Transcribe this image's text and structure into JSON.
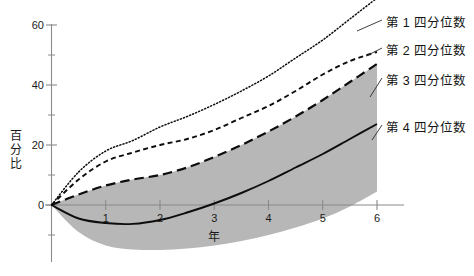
{
  "chart_data": {
    "type": "line",
    "title": "",
    "xlabel": "年",
    "ylabel": "百分比",
    "xlim": [
      0,
      6
    ],
    "ylim": [
      -20,
      72
    ],
    "grid": false,
    "legend_position": "right",
    "x_ticks": [
      "1",
      "2",
      "3",
      "4",
      "5",
      "6"
    ],
    "x_tick_values": [
      1,
      2,
      3,
      4,
      5,
      6
    ],
    "y_ticks": [
      "0",
      "20",
      "40",
      "60"
    ],
    "y_tick_values": [
      0,
      20,
      40,
      60
    ],
    "y_minor_tick_values": [
      -10,
      10,
      30,
      50,
      70
    ],
    "x": [
      0,
      0.5,
      1,
      1.5,
      2,
      2.5,
      3,
      3.5,
      4,
      4.5,
      5,
      5.5,
      6
    ],
    "series": [
      {
        "name": "第 1 四分位数",
        "style": "dotted",
        "values": [
          0,
          11,
          18,
          21.5,
          26,
          29.5,
          33.5,
          38,
          43,
          49,
          55,
          62,
          69
        ]
      },
      {
        "name": "第 2 四分位数",
        "style": "short-dashed",
        "values": [
          0,
          8.5,
          14.5,
          17.5,
          20,
          22,
          25,
          29,
          33,
          38,
          43.5,
          48,
          51
        ]
      },
      {
        "name": "第 3 四分位数",
        "style": "long-dashed",
        "values": [
          0,
          3.5,
          6.5,
          8.5,
          10,
          12.5,
          16,
          20,
          24.5,
          29.5,
          35,
          41,
          47
        ]
      },
      {
        "name": "第 4 四分位数",
        "style": "solid",
        "values": [
          0,
          -4.5,
          -6,
          -6.3,
          -5,
          -2.5,
          0.5,
          4,
          8,
          12.5,
          17,
          22,
          27
        ]
      }
    ],
    "band": {
      "name": "range-band",
      "color": "#b7b7b7",
      "upper": [
        0,
        3.5,
        6.5,
        8.5,
        10,
        12.5,
        16,
        20,
        24.5,
        29.5,
        35,
        41,
        47
      ],
      "lower": [
        0,
        -9,
        -13.5,
        -14.8,
        -15,
        -14.5,
        -13.5,
        -12,
        -10,
        -7.5,
        -4.5,
        -0.5,
        4.5
      ]
    },
    "legend": [
      {
        "label": "第 1 四分位数"
      },
      {
        "label": "第 2 四分位数"
      },
      {
        "label": "第 3 四分位数"
      },
      {
        "label": "第 4 四分位数"
      }
    ]
  },
  "axis": {
    "y_label_chars": [
      "百",
      "分",
      "比"
    ],
    "x_label": "年",
    "y_tick_0": "0",
    "y_tick_20": "20",
    "y_tick_40": "40",
    "y_tick_60": "60",
    "x_tick_1": "1",
    "x_tick_2": "2",
    "x_tick_3": "3",
    "x_tick_4": "4",
    "x_tick_5": "5",
    "x_tick_6": "6"
  },
  "colors": {
    "background": "#ffffff",
    "band": "#b7b7b7",
    "line": "#0d0d0d",
    "axis": "#8a8a8a",
    "text": "#141414"
  }
}
